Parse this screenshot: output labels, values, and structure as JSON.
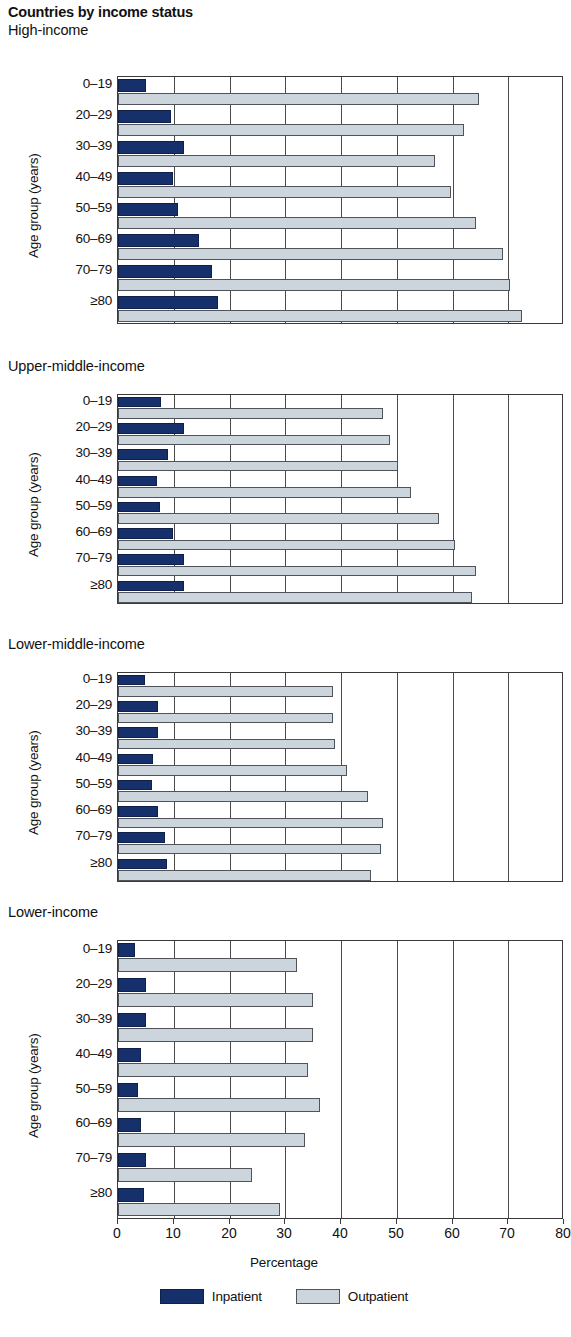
{
  "title": "Countries by income status",
  "axis": {
    "ylabel": "Age group (years)",
    "xlabel": "Percentage",
    "xticks": [
      "0",
      "10",
      "20",
      "30",
      "40",
      "50",
      "60",
      "70",
      "80"
    ],
    "categories": [
      "0–19",
      "20–29",
      "30–39",
      "40–49",
      "50–59",
      "60–69",
      "70–79",
      "≥80"
    ]
  },
  "legend": {
    "items": [
      {
        "label": "Inpatient",
        "color": "#16306b"
      },
      {
        "label": "Outpatient",
        "color": "#ccd4dc"
      }
    ]
  },
  "panels": [
    {
      "title": "High-income"
    },
    {
      "title": "Upper-middle-income"
    },
    {
      "title": "Lower-middle-income"
    },
    {
      "title": "Lower-income"
    }
  ],
  "chart_data": {
    "type": "bar",
    "orientation": "horizontal",
    "title": "Countries by income status",
    "xlabel": "Percentage",
    "ylabel": "Age group (years)",
    "xlim": [
      0,
      80
    ],
    "xticks": [
      0,
      10,
      20,
      30,
      40,
      50,
      60,
      70,
      80
    ],
    "grid": true,
    "legend_position": "bottom",
    "categories": [
      "0–19",
      "20–29",
      "30–39",
      "40–49",
      "50–59",
      "60–69",
      "70–79",
      "≥80"
    ],
    "panels": [
      {
        "title": "High-income",
        "series": [
          {
            "name": "Inpatient",
            "values": [
              5.0,
              9.5,
              11.8,
              9.8,
              10.8,
              14.5,
              16.8,
              18.0
            ]
          },
          {
            "name": "Outpatient",
            "values": [
              64.8,
              62.0,
              56.8,
              59.8,
              64.3,
              69.0,
              70.3,
              72.5
            ]
          }
        ]
      },
      {
        "title": "Upper-middle-income",
        "series": [
          {
            "name": "Inpatient",
            "values": [
              7.8,
              11.8,
              8.9,
              7.0,
              7.6,
              9.8,
              11.8,
              11.9
            ]
          },
          {
            "name": "Outpatient",
            "values": [
              47.5,
              48.8,
              50.3,
              52.5,
              57.5,
              60.5,
              64.3,
              63.5
            ]
          }
        ]
      },
      {
        "title": "Lower-middle-income",
        "series": [
          {
            "name": "Inpatient",
            "values": [
              4.8,
              7.2,
              7.2,
              6.2,
              6.1,
              7.2,
              8.4,
              8.8
            ]
          },
          {
            "name": "Outpatient",
            "values": [
              38.5,
              38.6,
              38.9,
              41.0,
              44.8,
              47.5,
              47.1,
              45.3
            ]
          }
        ]
      },
      {
        "title": "Lower-income",
        "series": [
          {
            "name": "Inpatient",
            "values": [
              3.1,
              5.1,
              5.1,
              4.1,
              3.6,
              4.1,
              5.1,
              4.7
            ]
          },
          {
            "name": "Outpatient",
            "values": [
              32.1,
              35.0,
              35.0,
              34.0,
              36.2,
              33.5,
              24.0,
              29.0
            ]
          }
        ]
      }
    ]
  }
}
